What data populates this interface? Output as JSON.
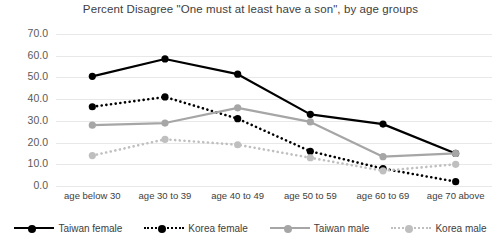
{
  "chart_data": {
    "type": "line",
    "title": "Percent Disagree \"One must at least have a son\", by age groups",
    "xlabel": "",
    "ylabel": "",
    "ylim": [
      0,
      70
    ],
    "ytick_step": 10,
    "grid": true,
    "legend_position": "bottom",
    "categories": [
      "age below 30",
      "age 30 to 39",
      "age 40 to 49",
      "age 50 to 59",
      "age 60 to 69",
      "age 70 above"
    ],
    "ytick_labels": [
      "70.0",
      "60.0",
      "50.0",
      "40.0",
      "30.0",
      "20.0",
      "10.0",
      "0.0"
    ],
    "series": [
      {
        "name": "Taiwan female",
        "color": "#000000",
        "style": "solid",
        "values": [
          50.5,
          58.5,
          51.5,
          33.0,
          28.5,
          15.0
        ]
      },
      {
        "name": "Korea female",
        "color": "#000000",
        "style": "dotted",
        "values": [
          36.5,
          41.0,
          31.0,
          16.0,
          8.0,
          2.0
        ]
      },
      {
        "name": "Taiwan male",
        "color": "#a6a6a6",
        "style": "solid",
        "values": [
          28.0,
          29.0,
          36.0,
          29.5,
          13.5,
          15.0
        ]
      },
      {
        "name": "Korea male",
        "color": "#bfbfbf",
        "style": "dotted",
        "values": [
          14.0,
          21.5,
          19.0,
          13.0,
          7.0,
          10.0
        ]
      }
    ]
  }
}
